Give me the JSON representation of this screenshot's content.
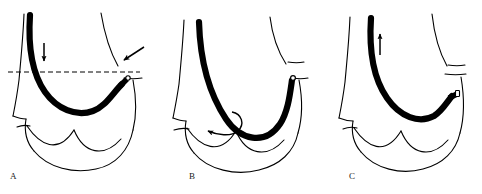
{
  "figure": {
    "type": "anatomical-line-diagram",
    "background_color": "#ffffff",
    "ink_color": "#000000",
    "label_color": "#1a1a1a",
    "width": 482,
    "height": 194,
    "panel_count": 3
  },
  "panels": [
    {
      "id": "A",
      "label": "A",
      "label_x": 10,
      "label_y": 172,
      "origin_x": 0,
      "description": "Instrument advanced downward; dashed reference line marks level; straight arrow points down along shaft and a second straight arrow points down-left toward the tip.",
      "annotations": [
        {
          "name": "dashed-reference-line",
          "kind": "dashed-line",
          "x1": 8,
          "y1": 72,
          "x2": 140,
          "y2": 72,
          "dash": "5 3"
        },
        {
          "name": "down-arrow",
          "kind": "straight-arrow",
          "direction": "down",
          "x1": 44,
          "y1": 43,
          "x2": 44,
          "y2": 62
        },
        {
          "name": "tip-pointer-arrow",
          "kind": "straight-arrow",
          "direction": "down-left",
          "x1": 143,
          "y1": 48,
          "x2": 122,
          "y2": 60
        }
      ]
    },
    {
      "id": "B",
      "label": "B",
      "label_x": 189,
      "label_y": 172,
      "origin_x": 160,
      "description": "Instrument seated at the base; a curved hooked arrow indicates rotation/sweep of the tip within the cavity.",
      "annotations": [
        {
          "name": "curved-rotation-arrow",
          "kind": "curved-arrow",
          "direction": "counterclockwise",
          "start_x": 232,
          "start_y": 112,
          "end_x": 206,
          "end_y": 133
        }
      ]
    },
    {
      "id": "C",
      "label": "C",
      "label_x": 349,
      "label_y": 172,
      "origin_x": 321,
      "description": "Instrument withdrawn upward; a straight arrow points up along the shaft.",
      "annotations": [
        {
          "name": "up-arrow",
          "kind": "straight-arrow",
          "direction": "up",
          "x1": 380,
          "y1": 55,
          "x2": 380,
          "y2": 33
        }
      ]
    }
  ],
  "legend_note": ""
}
